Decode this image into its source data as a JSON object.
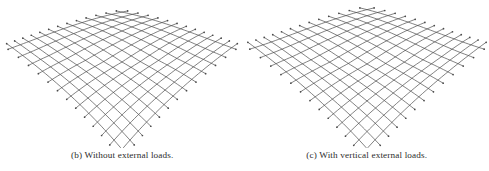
{
  "page": {
    "background_color": "#ffffff",
    "figure_label": "gridshell-comparison",
    "line_color": "#4a4a4a",
    "caption_color": "#2b2b2b"
  },
  "subfigures": [
    {
      "id": "b",
      "caption": "(b) Without external loads.",
      "name": "subfigure-b-without-external-loads"
    },
    {
      "id": "c",
      "caption": "(c) With vertical external loads.",
      "name": "subfigure-c-with-vertical-external-loads"
    }
  ],
  "chart_data": {
    "type": "line",
    "title": "",
    "xlabel": "",
    "ylabel": "",
    "grid": false,
    "legend": null,
    "panels": [
      {
        "id": "b",
        "label": "(b) Without external loads.",
        "viewbox": [
          0,
          0,
          244,
          148
        ],
        "surface": {
          "model": "hypar",
          "u_count": 13,
          "v_count": 13,
          "center": [
            122,
            62
          ],
          "half_width": 96,
          "half_depth": 78,
          "sag": 26,
          "rise": 17,
          "perspective_taper": 0.42,
          "overhang": 9
        }
      },
      {
        "id": "c",
        "label": "(c) With vertical external loads.",
        "viewbox": [
          0,
          0,
          244,
          148
        ],
        "surface": {
          "model": "hypar",
          "u_count": 13,
          "v_count": 13,
          "center": [
            122,
            64
          ],
          "half_width": 99,
          "half_depth": 78,
          "sag": 30,
          "rise": 12,
          "perspective_taper": 0.45,
          "overhang": 11
        }
      }
    ]
  }
}
